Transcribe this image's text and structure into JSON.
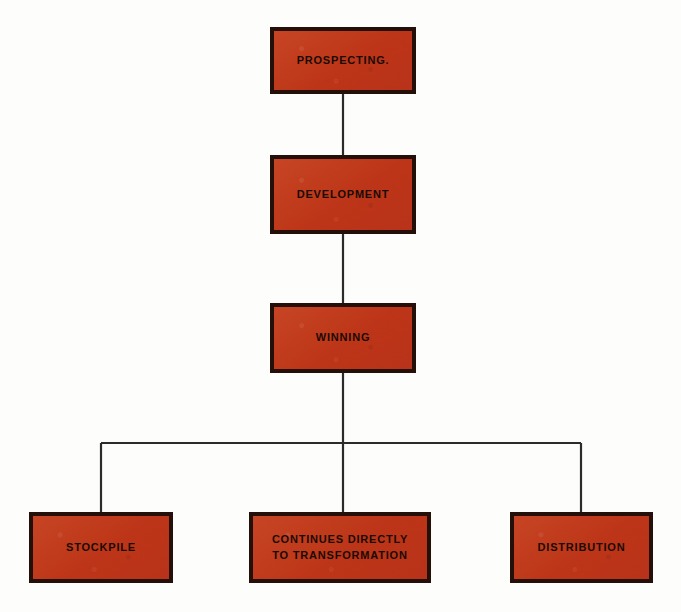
{
  "diagram": {
    "colors": {
      "node_fill": "#c0391b",
      "node_border": "#241008",
      "connector": "#2b2b2b",
      "background": "#fdfdfb",
      "label_text": "#1a0b05"
    },
    "nodes": [
      {
        "id": "prospecting",
        "label": "PROSPECTING."
      },
      {
        "id": "development",
        "label": "DEVELOPMENT"
      },
      {
        "id": "winning",
        "label": "WINNING"
      },
      {
        "id": "stockpile",
        "label": "STOCKPILE"
      },
      {
        "id": "continues",
        "label": "CONTINUES DIRECTLY\nTO TRANSFORMATION"
      },
      {
        "id": "distribution",
        "label": "DISTRIBUTION"
      }
    ],
    "edges": [
      {
        "from": "prospecting",
        "to": "development"
      },
      {
        "from": "development",
        "to": "winning"
      },
      {
        "from": "winning",
        "to": "stockpile"
      },
      {
        "from": "winning",
        "to": "continues"
      },
      {
        "from": "winning",
        "to": "distribution"
      }
    ]
  }
}
